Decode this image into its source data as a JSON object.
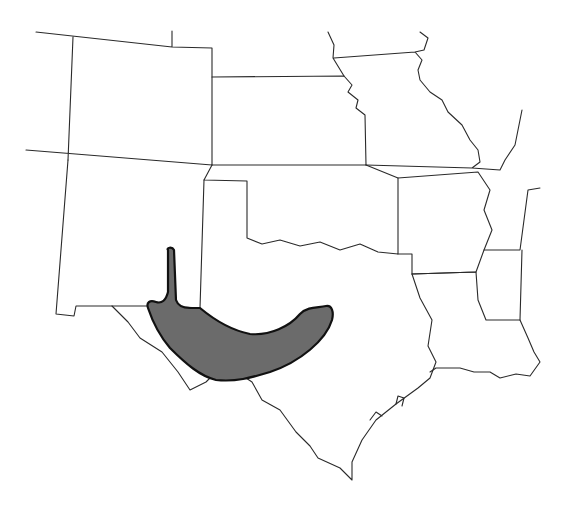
{
  "map": {
    "type": "species range map",
    "region": "South-central United States",
    "states_shown": [
      "Colorado",
      "Kansas",
      "Missouri",
      "Illinois",
      "New Mexico",
      "Oklahoma",
      "Arkansas",
      "Texas",
      "Louisiana",
      "Mississippi"
    ],
    "range_fill_color": "#6b6b6b",
    "border_color": "#2a2a2a",
    "background_color": "#ffffff",
    "range_description": "Shaded range across west-central Texas (Edwards Plateau / Trans-Pecos) with a narrow northward extension into southeastern New Mexico",
    "labels": []
  }
}
